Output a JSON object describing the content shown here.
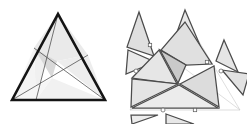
{
  "figure": {
    "canvas": {
      "width": 247,
      "height": 124,
      "background": "#ffffff"
    },
    "palette": {
      "background": "#ffffff",
      "outline": "#141414",
      "cevian_line": "#4a4a4a",
      "piece_edge": "#4b4b4b",
      "guide_line": "#c8c8c8",
      "fill_light": "#f2f2f2",
      "fill_mid": "#e3e3e3",
      "fill_dark": "#cfcfcf",
      "marker_fill": "#ffffff",
      "marker_stroke": "#5a5a5a"
    }
  },
  "panels": [
    {
      "id": "assembled",
      "label": "assembled-triangle",
      "outline": "12,100 58,14 105,100",
      "cevians": [
        {
          "name": "cevian-a",
          "from": "58,14",
          "to": "36,100"
        },
        {
          "name": "cevian-b",
          "from": "12,100",
          "to": "88,55"
        },
        {
          "name": "cevian-c",
          "from": "105,100",
          "to": "34,48"
        }
      ],
      "regions": [
        {
          "name": "region-top-left",
          "points": "58,14 36,100 34,48",
          "fill": "#f0f0f0"
        },
        {
          "name": "region-left-wedge",
          "points": "12,100 34,48 36,100",
          "fill": "#f4f4f4"
        },
        {
          "name": "region-center",
          "points": "34,48 57,61 52,78",
          "fill": "#d9d9d9"
        },
        {
          "name": "region-top-right",
          "points": "58,14 88,55 57,61 34,48",
          "fill": "#eaeaea"
        },
        {
          "name": "region-right",
          "points": "88,55 105,100 57,61",
          "fill": "#ededed"
        },
        {
          "name": "region-bottom",
          "points": "36,100 105,100 52,78",
          "fill": "#f1f1f1"
        },
        {
          "name": "region-bottom-left",
          "points": "12,100 36,100 52,78",
          "fill": "#f6f6f6"
        }
      ]
    },
    {
      "id": "exploded",
      "label": "exploded-triangle",
      "guides": [
        {
          "name": "guide-left-edge",
          "from": "130,110",
          "to": "185,18"
        },
        {
          "name": "guide-right-edge",
          "from": "185,18",
          "to": "240,110"
        },
        {
          "name": "guide-base",
          "from": "130,110",
          "to": "240,110"
        },
        {
          "name": "guide-cevian-a",
          "from": "185,18",
          "to": "163,110"
        },
        {
          "name": "guide-cevian-b",
          "from": "130,110",
          "to": "215,66"
        },
        {
          "name": "guide-cevian-c",
          "from": "240,110",
          "to": "160,50"
        }
      ],
      "core_pieces": [
        {
          "name": "piece-center",
          "points": "160,50 186,65 178,83",
          "fill": "#c9c9c9",
          "edge": "piece-edge"
        },
        {
          "name": "piece-upper-right",
          "points": "185,22 212,64 186,65 161,50",
          "fill": "#e0e0e0",
          "edge": "piece-edge"
        },
        {
          "name": "piece-left-mid",
          "points": "132,78 159,50 177,84",
          "fill": "#e6e6e6",
          "edge": "piece-edge"
        },
        {
          "name": "piece-lower-left",
          "points": "131,107 132,79 178,84",
          "fill": "#e4e4e4",
          "edge": "piece-edge"
        },
        {
          "name": "piece-lower-mid",
          "points": "132,108 179,85 218,108",
          "fill": "#ececec",
          "edge": "piece-edge"
        },
        {
          "name": "piece-lower-right",
          "points": "180,84 214,66 219,107",
          "fill": "#dcdcdc",
          "edge": "piece-edge"
        }
      ],
      "detached_pieces": [
        {
          "name": "detached-top-left-a",
          "points": "139,12 154,56 127,47",
          "fill": "#dfdfdf"
        },
        {
          "name": "detached-top-left-b",
          "points": "128,50 155,62 126,74",
          "fill": "#e9e9e9"
        },
        {
          "name": "detached-apex",
          "points": "185,10 205,57 168,57",
          "fill": "#e8e8e8"
        },
        {
          "name": "detached-right-upper",
          "points": "224,40 238,72 216,61",
          "fill": "#e5e5e5"
        },
        {
          "name": "detached-right-lower",
          "points": "222,70 249,74 243,95",
          "fill": "#e2e2e2"
        },
        {
          "name": "detached-bottom-left",
          "points": "131,115 158,115 132,124",
          "fill": "#ededed"
        },
        {
          "name": "detached-bottom-right",
          "points": "166,114 194,124 166,124",
          "fill": "#e7e7e7"
        }
      ],
      "markers": [
        {
          "name": "vertex-marker-square-upper-left",
          "shape": "square",
          "x": 150,
          "y": 45
        },
        {
          "name": "vertex-marker-square-upper-right",
          "shape": "square",
          "x": 207,
          "y": 62
        },
        {
          "name": "vertex-marker-circle-left",
          "shape": "circle",
          "x": 136,
          "y": 71
        },
        {
          "name": "vertex-marker-circle-right",
          "shape": "circle",
          "x": 221,
          "y": 71
        },
        {
          "name": "vertex-marker-circle-bottom",
          "shape": "circle",
          "x": 163,
          "y": 110
        },
        {
          "name": "vertex-marker-square-bottom",
          "shape": "square",
          "x": 195,
          "y": 110
        }
      ]
    }
  ]
}
